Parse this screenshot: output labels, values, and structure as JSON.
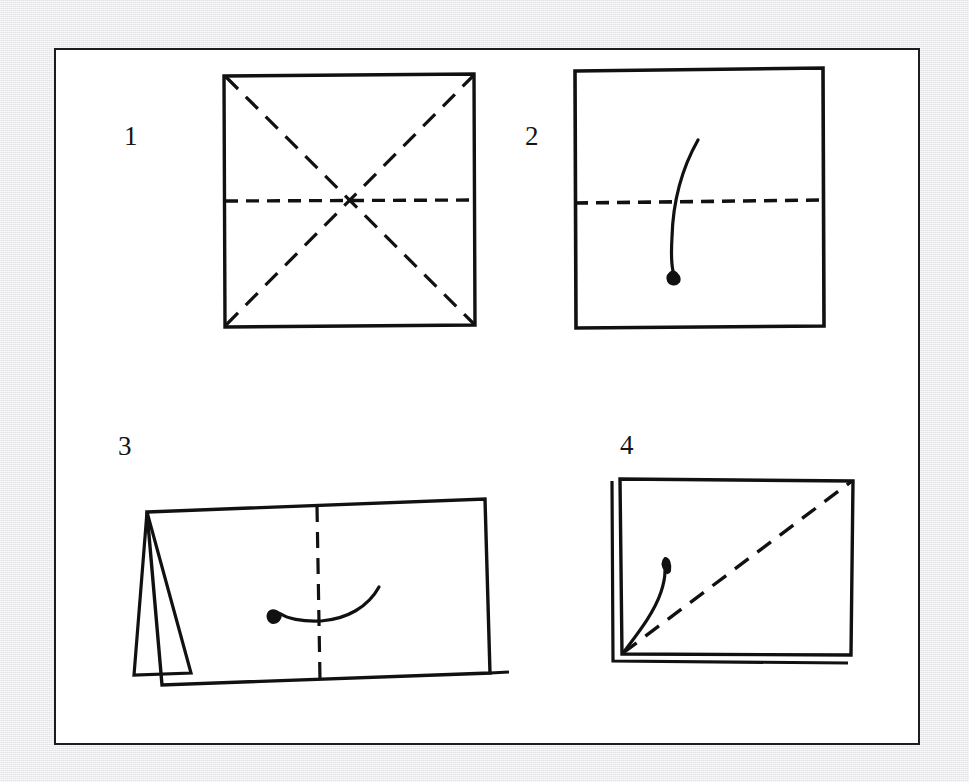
{
  "figure": {
    "kind": "origami-instruction-diagram",
    "panel_background": "#ffffff",
    "page_background": "#ededef",
    "ink_color": "#111111",
    "border_color": "#1d1d1f",
    "steps": [
      {
        "number": "1",
        "caption": "",
        "shape": "square",
        "creases": [
          "diagonal-tl-br",
          "diagonal-bl-tr",
          "horizontal-center"
        ],
        "crease_style": "dashed",
        "arrow": "none"
      },
      {
        "number": "2",
        "caption": "",
        "shape": "square",
        "creases": [
          "horizontal-center"
        ],
        "crease_style": "dashed",
        "arrow": "curved-fold-down"
      },
      {
        "number": "3",
        "caption": "",
        "shape": "folded-tent",
        "creases": [
          "vertical-center"
        ],
        "crease_style": "dashed",
        "arrow": "curved-fold-left"
      },
      {
        "number": "4",
        "caption": "",
        "shape": "square-with-layer",
        "creases": [
          "diagonal-bl-tr"
        ],
        "crease_style": "dashed",
        "arrow": "curved-fold-up"
      }
    ]
  }
}
